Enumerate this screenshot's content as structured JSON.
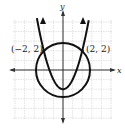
{
  "chart_data": {
    "type": "line",
    "title": "",
    "xlabel": "x",
    "ylabel": "y",
    "xlim": [
      -5,
      5
    ],
    "ylim": [
      -5,
      5
    ],
    "grid": true,
    "series": [
      {
        "name": "parabola",
        "equation": "y = x^2 - 2",
        "vertex": [
          0,
          -2
        ]
      },
      {
        "name": "circle",
        "equation": "x^2 + y^2 = 8",
        "center": [
          0,
          0
        ],
        "radius": 2.83
      }
    ],
    "annotations": [
      {
        "label": "(−2, 2)",
        "x": -2,
        "y": 2
      },
      {
        "label": "(2, 2)",
        "x": 2,
        "y": 2
      }
    ]
  },
  "axes": {
    "x_label": "x",
    "y_label": "y"
  },
  "points": [
    {
      "label": "(−2, 2)"
    },
    {
      "label": "(2, 2)"
    }
  ],
  "colors": {
    "curve": "#111111",
    "axis": "#333333",
    "grid": "#cfcfcf"
  }
}
